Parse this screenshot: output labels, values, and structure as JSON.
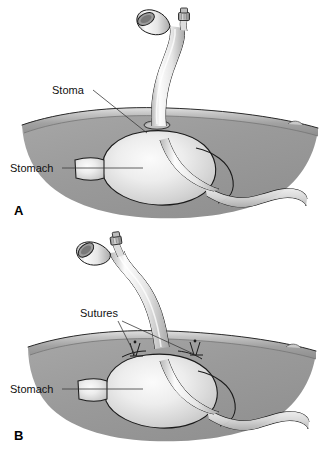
{
  "figure": {
    "type": "medical-illustration",
    "style": "grayscale line and tone drawing",
    "panel_count": 2
  },
  "colors": {
    "background": "#ffffff",
    "line": "#1a1a1a",
    "leader_line": "#3a3a3a",
    "label_text": "#111111",
    "abdominal_wall_light": "#d8d8d8",
    "abdominal_wall_mid": "#a8a8a8",
    "abdominal_wall_dark": "#8a8a8a",
    "cavity_fill": "#9a9a9a",
    "stomach_light": "#f0f0f0",
    "stomach_mid": "#cfcfcf",
    "tube_highlight": "#fafafa",
    "tube_shadow": "#b5b5b5",
    "connector_grey": "#9e9e9e"
  },
  "panels": [
    {
      "id": "A",
      "letter": "A",
      "letter_x": 14,
      "letter_y": 215,
      "labels": [
        {
          "name": "stoma",
          "text": "Stoma",
          "text_x": 52,
          "text_y": 94,
          "leaders": [
            {
              "x1": 93,
              "y1": 90,
              "x2": 147,
              "y2": 133
            }
          ]
        },
        {
          "name": "stomach",
          "text": "Stomach",
          "text_x": 10,
          "text_y": 172,
          "leaders": [
            {
              "x1": 62,
              "y1": 168,
              "x2": 143,
              "y2": 168
            }
          ]
        }
      ],
      "tube": {
        "description": "gastrostomy tube entering abdominal wall through stoma",
        "main_port_label": "feeding lumen",
        "balloon_port_label": "balloon inflation port"
      },
      "sutures_present": false
    },
    {
      "id": "B",
      "letter": "B",
      "letter_x": 14,
      "letter_y": 215,
      "labels": [
        {
          "name": "sutures",
          "text": "Sutures",
          "text_x": 80,
          "text_y": 92,
          "leaders": [
            {
              "x1": 118,
              "y1": 96,
              "x2": 136,
              "y2": 132
            },
            {
              "x1": 122,
              "y1": 96,
              "x2": 196,
              "y2": 130
            }
          ]
        },
        {
          "name": "stomach",
          "text": "Stomach",
          "text_x": 10,
          "text_y": 168,
          "leaders": [
            {
              "x1": 62,
              "y1": 164,
              "x2": 143,
              "y2": 164
            }
          ]
        }
      ],
      "tube": {
        "description": "gastrostomy tube entering abdominal wall, stomach sutured to wall",
        "main_port_label": "feeding lumen",
        "balloon_port_label": "balloon inflation port"
      },
      "sutures_present": true,
      "suture_count": 2
    }
  ]
}
